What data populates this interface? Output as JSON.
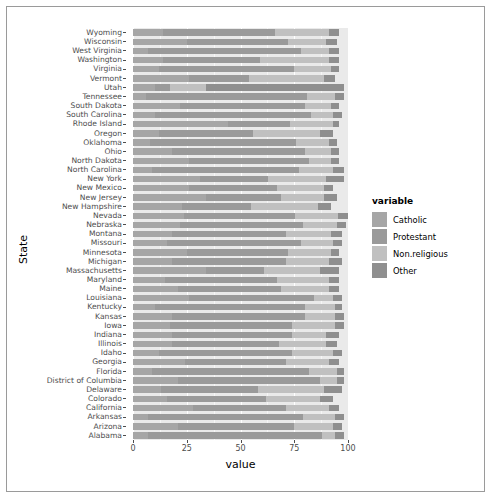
{
  "chart_data": {
    "type": "bar",
    "orientation": "horizontal",
    "stacked": true,
    "title": "",
    "xlabel": "value",
    "ylabel": "State",
    "xlim": [
      0,
      100
    ],
    "xticks": [
      0,
      25,
      50,
      75,
      100
    ],
    "xticklabels": [
      "0",
      "25",
      "50",
      "75",
      "100"
    ],
    "grid": true,
    "legend": {
      "title": "variable",
      "position": "right",
      "entries": [
        "Catholic",
        "Protestant",
        "Non.religious",
        "Other"
      ]
    },
    "colors": {
      "Catholic": "#a6a6a6",
      "Protestant": "#9a9a9a",
      "Non.religious": "#c0c0c0",
      "Other": "#8f8f8f",
      "panel_background": "#eaeaea",
      "grid_major": "#ffffff",
      "grid_minor": "#f6f6f6",
      "axis_text": "#4d4d4d",
      "frame_border": "#9a9a9a"
    },
    "series": [
      {
        "name": "Catholic",
        "values": [
          14,
          25,
          7,
          14,
          12,
          26,
          10,
          6,
          22,
          10,
          44,
          12,
          8,
          18,
          26,
          9,
          31,
          26,
          34,
          23,
          25,
          22,
          18,
          16,
          25,
          18,
          34,
          15,
          21,
          26,
          10,
          18,
          17,
          18,
          18,
          12,
          24,
          9,
          21,
          13,
          16,
          28,
          7,
          21,
          7
        ]
      },
      {
        "name": "Protestant",
        "values": [
          52,
          47,
          71,
          45,
          63,
          28,
          7,
          75,
          58,
          73,
          29,
          44,
          68,
          62,
          56,
          68,
          32,
          41,
          35,
          32,
          54,
          57,
          53,
          62,
          47,
          53,
          27,
          52,
          48,
          58,
          70,
          62,
          57,
          56,
          50,
          62,
          47,
          73,
          66,
          45,
          46,
          43,
          72,
          54,
          81
        ]
      },
      {
        "name": "Non.religious",
        "values": [
          25,
          18,
          13,
          32,
          17,
          35,
          17,
          13,
          12,
          10,
          20,
          31,
          15,
          12,
          10,
          16,
          27,
          22,
          20,
          31,
          21,
          16,
          21,
          15,
          20,
          20,
          26,
          24,
          22,
          9,
          14,
          14,
          20,
          16,
          22,
          19,
          20,
          13,
          8,
          31,
          25,
          20,
          15,
          18,
          6
        ]
      },
      {
        "name": "Other",
        "values": [
          5,
          5,
          5,
          5,
          4,
          5,
          64,
          4,
          4,
          4,
          3,
          6,
          4,
          4,
          4,
          5,
          8,
          4,
          6,
          6,
          5,
          4,
          5,
          4,
          4,
          6,
          9,
          5,
          5,
          4,
          3,
          4,
          4,
          6,
          5,
          4,
          5,
          3,
          3,
          8,
          6,
          5,
          4,
          4,
          4
        ]
      }
    ],
    "categories": [
      "Wyoming",
      "Wisconsin",
      "West Virginia",
      "Washington",
      "Virginia",
      "Vermont",
      "Utah",
      "Tennessee",
      "South Dakota",
      "South Carolina",
      "Rhode Island",
      "Oregon",
      "Oklahoma",
      "Ohio",
      "North Dakota",
      "North Carolina",
      "New York",
      "New Mexico",
      "New Jersey",
      "New Hampshire",
      "Nevada",
      "Nebraska",
      "Montana",
      "Missouri",
      "Minnesota",
      "Michigan",
      "Massachusetts",
      "Maryland",
      "Maine",
      "Louisiana",
      "Kentucky",
      "Kansas",
      "Iowa",
      "Indiana",
      "Illinois",
      "Idaho",
      "Georgia",
      "Florida",
      "District of Columbia",
      "Delaware",
      "Colorado",
      "California",
      "Arkansas",
      "Arizona",
      "Alabama"
    ]
  }
}
